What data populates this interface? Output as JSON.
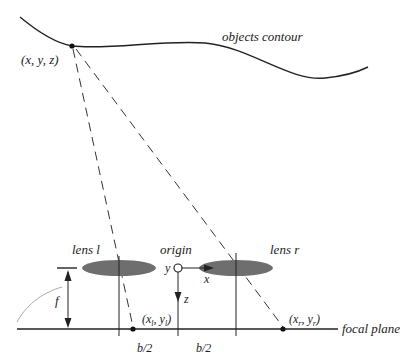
{
  "labels": {
    "point": "(x, y, z)",
    "contour": "objects contour",
    "lens_left": "lens l",
    "lens_right": "lens r",
    "origin": "origin",
    "axis_y": "y",
    "axis_x": "x",
    "axis_z": "z",
    "focal_length": "f",
    "image_left": "(x",
    "image_left_sub1": "l",
    "image_left_mid": ", y",
    "image_left_sub2": "l",
    "image_left_end": ")",
    "image_right": "(x",
    "image_right_sub1": "r",
    "image_right_mid": ", y",
    "image_right_sub2": "r",
    "image_right_end": ")",
    "half_baseline_left": "b/2",
    "half_baseline_right": "b/2",
    "focal_plane": "focal plane"
  },
  "colors": {
    "line": "#222222",
    "lens_fill": "#6e6e6e",
    "gray_arc": "#aaaaaa"
  }
}
